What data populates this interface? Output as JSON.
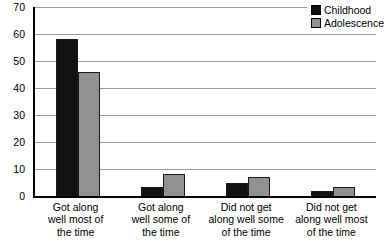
{
  "chart_data": {
    "type": "bar",
    "title": "",
    "xlabel": "",
    "ylabel": "",
    "ylim": [
      0,
      70
    ],
    "yticks": [
      0,
      10,
      20,
      30,
      40,
      50,
      60,
      70
    ],
    "grid": true,
    "legend_position": "top-right",
    "categories": [
      "Got along well most of the time",
      "Got along well some of the time",
      "Did not get along well some of the time",
      "Did not get along well most of the time"
    ],
    "category_labels_wrapped": [
      "Got along\nwell most of\nthe time",
      "Got along\nwell some of\nthe time",
      "Did not get\nalong well some\nof the time",
      "Did not get\nalong well most\nof the time"
    ],
    "series": [
      {
        "name": "Childhood",
        "color": "#111111",
        "values": [
          58,
          3.5,
          5,
          2
        ]
      },
      {
        "name": "Adolescence",
        "color": "#919191",
        "values": [
          46,
          8,
          7,
          3.5
        ]
      }
    ]
  },
  "colors": {
    "background": "#ffffff",
    "gridline": "#9b9b9b",
    "axis": "#000000",
    "bar_border": "#1a1a1a",
    "text": "#000000"
  }
}
